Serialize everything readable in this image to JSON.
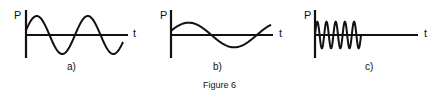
{
  "figure": {
    "caption": "Figure 6",
    "panels": [
      {
        "label": "a)",
        "y_axis": "P",
        "x_axis": "t",
        "description": "sine wave, ~2 cycles, medium amplitude"
      },
      {
        "label": "b)",
        "y_axis": "P",
        "x_axis": "t",
        "description": "sine wave, ~1 cycle, lower amplitude, longer period"
      },
      {
        "label": "c)",
        "y_axis": "P",
        "x_axis": "t",
        "description": "high-frequency oscillation, ~5 cycles, short duration then stops"
      }
    ]
  },
  "chart_data": [
    {
      "type": "line",
      "title": "a)",
      "xlabel": "t",
      "ylabel": "P",
      "cycles": 1.9,
      "relative_amplitude": 1.0
    },
    {
      "type": "line",
      "title": "b)",
      "xlabel": "t",
      "ylabel": "P",
      "cycles": 1.0,
      "relative_amplitude": 0.65
    },
    {
      "type": "line",
      "title": "c)",
      "xlabel": "t",
      "ylabel": "P",
      "cycles": 5,
      "relative_amplitude": 0.7,
      "note": "oscillation stops after short time"
    }
  ]
}
